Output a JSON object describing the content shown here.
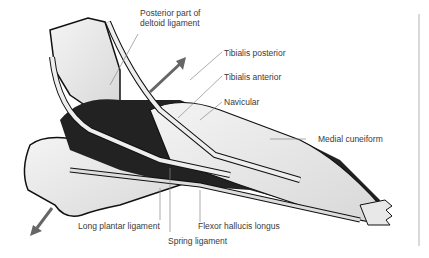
{
  "figure": {
    "labels": [
      {
        "id": "posterior-deltoid",
        "text_line1": "Posterior part of",
        "text_line2": "deltoid ligament"
      },
      {
        "id": "tibialis-posterior",
        "text": "Tibialis posterior"
      },
      {
        "id": "tibialis-anterior",
        "text": "Tibialis anterior"
      },
      {
        "id": "navicular",
        "text": "Navicular"
      },
      {
        "id": "medial-cuneiform",
        "text": "Medial cuneiform"
      },
      {
        "id": "long-plantar-ligament",
        "text": "Long plantar ligament"
      },
      {
        "id": "spring-ligament",
        "text": "Spring ligament"
      },
      {
        "id": "flexor-hallucis-longus",
        "text": "Flexor hallucis longus"
      }
    ],
    "arrows": [
      {
        "id": "upward-pull-arrow",
        "direction": "up-right"
      },
      {
        "id": "downward-pull-arrow",
        "direction": "down-left"
      }
    ]
  }
}
